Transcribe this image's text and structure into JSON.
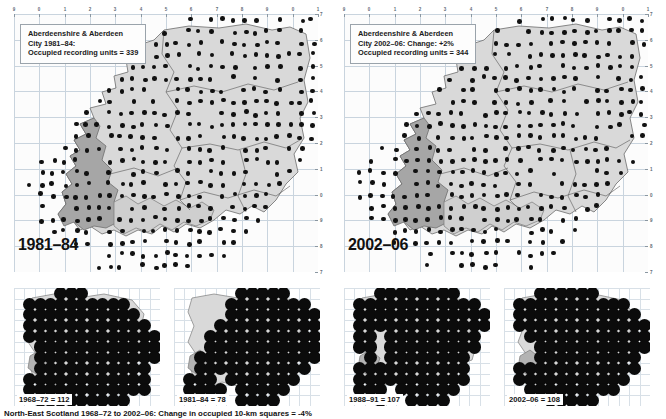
{
  "figure": {
    "footnote": "North-East Scotland 1968–72 to 2002–06: Change in occupied 10-km squares = -4%",
    "dot_color": "#111111",
    "land_light": "#d7d7d7",
    "land_dark": "#9d9d9d",
    "grid_color": "#c9d4de"
  },
  "maps": [
    {
      "id": "map-1981-84",
      "title_line1": "Aberdeenshire & Aberdeen",
      "title_line2": "City 1981–84:",
      "title_line3_prefix": "Occupied recording units = ",
      "title_line3_value": "339",
      "year_label": "1981–84",
      "top_ticks": [
        "9",
        "0",
        "1",
        "2",
        "3",
        "4",
        "5",
        "6",
        "7",
        "8",
        "9",
        "0",
        "1"
      ],
      "right_ticks": [
        "7",
        "6",
        "5",
        "4",
        "3",
        "2",
        "1",
        "0",
        "9",
        "8",
        "7"
      ]
    },
    {
      "id": "map-2002-06",
      "title_line1": "Aberdeenshire & Aberdeen",
      "title_line2": "City 2002–06: Change: +2%",
      "title_line3_prefix": "Occupied recording units = ",
      "title_line3_value": "344",
      "year_label": "2002–06",
      "top_ticks": [
        "9",
        "0",
        "1",
        "2",
        "3",
        "4",
        "5",
        "6",
        "7",
        "8",
        "9",
        "0",
        "1"
      ],
      "right_ticks": [
        "7",
        "6",
        "5",
        "4",
        "3",
        "2",
        "1",
        "0",
        "9",
        "8",
        "7"
      ]
    }
  ],
  "insets": [
    {
      "id": "inset-1968-72",
      "label": "1968–72 = 112",
      "period": "1968–72",
      "count": 112
    },
    {
      "id": "inset-1981-84",
      "label": "1981–84 = 78",
      "period": "1981–84",
      "count": 78
    },
    {
      "id": "inset-1988-91",
      "label": "1988–91 = 107",
      "period": "1988–91",
      "count": 107
    },
    {
      "id": "inset-2002-06",
      "label": "2002–06 = 108",
      "period": "2002–06",
      "count": 108
    }
  ],
  "chart_data": {
    "type": "map",
    "categories": [
      "1968–72",
      "1981–84",
      "1988–91",
      "2002–06"
    ],
    "values": [
      112,
      78,
      107,
      108
    ],
    "ylabel": "Occupied 10-km squares",
    "annotations": [
      "Aberdeenshire & Aberdeen City 1981–84: Occupied recording units = 339",
      "Aberdeenshire & Aberdeen City 2002–06: Change: +2%; Occupied recording units = 344",
      "North-East Scotland 1968–72 to 2002–06: Change in occupied 10-km squares = -4%"
    ]
  }
}
